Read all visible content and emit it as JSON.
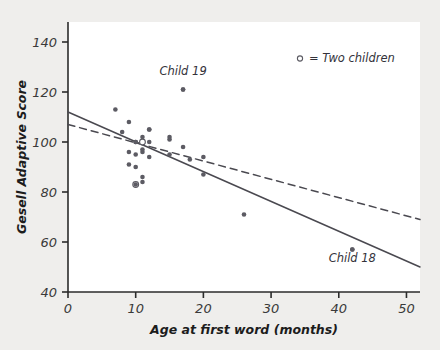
{
  "chart_data": {
    "type": "scatter",
    "title": "",
    "xlabel": "Age at first word (months)",
    "ylabel": "Gesell Adaptive Score",
    "xlim": [
      0,
      52
    ],
    "ylim": [
      40,
      148
    ],
    "xticks": [
      0,
      10,
      20,
      30,
      40,
      50
    ],
    "yticks": [
      40,
      60,
      80,
      100,
      120,
      140
    ],
    "xtick_labels": [
      "0",
      "10",
      "20",
      "30",
      "40",
      "50"
    ],
    "ytick_labels": [
      "40",
      "60",
      "80",
      "100",
      "120",
      "140"
    ],
    "grid": false,
    "legend_position": "top-right",
    "legend": [
      {
        "marker": "open-circle",
        "label": "= Two children"
      }
    ],
    "points": [
      {
        "x": 15,
        "y": 95,
        "marker": "filled"
      },
      {
        "x": 26,
        "y": 71,
        "marker": "filled"
      },
      {
        "x": 10,
        "y": 83,
        "marker": "open",
        "note": "two children"
      },
      {
        "x": 9,
        "y": 91,
        "marker": "filled"
      },
      {
        "x": 15,
        "y": 102,
        "marker": "filled"
      },
      {
        "x": 20,
        "y": 87,
        "marker": "filled"
      },
      {
        "x": 18,
        "y": 93,
        "marker": "filled"
      },
      {
        "x": 11,
        "y": 100,
        "marker": "open",
        "note": "two children"
      },
      {
        "x": 8,
        "y": 104,
        "marker": "filled"
      },
      {
        "x": 20,
        "y": 94,
        "marker": "filled"
      },
      {
        "x": 7,
        "y": 113,
        "marker": "filled"
      },
      {
        "x": 9,
        "y": 96,
        "marker": "filled"
      },
      {
        "x": 10,
        "y": 83,
        "marker": "filled"
      },
      {
        "x": 11,
        "y": 84,
        "marker": "filled"
      },
      {
        "x": 11,
        "y": 102,
        "marker": "filled"
      },
      {
        "x": 10,
        "y": 100,
        "marker": "filled"
      },
      {
        "x": 12,
        "y": 105,
        "marker": "filled"
      },
      {
        "x": 42,
        "y": 57,
        "marker": "filled",
        "label": "Child 18"
      },
      {
        "x": 17,
        "y": 121,
        "marker": "filled",
        "label": "Child 19"
      },
      {
        "x": 11,
        "y": 86,
        "marker": "filled"
      },
      {
        "x": 10,
        "y": 100,
        "marker": "filled"
      },
      {
        "x": 12,
        "y": 105,
        "marker": "filled"
      },
      {
        "x": 42,
        "y": 57,
        "marker": "filled"
      },
      {
        "x": 17,
        "y": 121,
        "marker": "filled"
      },
      {
        "x": 11,
        "y": 96,
        "marker": "filled"
      },
      {
        "x": 10,
        "y": 90,
        "marker": "filled"
      },
      {
        "x": 12,
        "y": 100,
        "marker": "filled"
      },
      {
        "x": 9,
        "y": 108,
        "marker": "filled"
      },
      {
        "x": 17,
        "y": 98,
        "marker": "filled"
      },
      {
        "x": 11,
        "y": 97,
        "marker": "filled"
      },
      {
        "x": 10,
        "y": 95,
        "marker": "filled"
      },
      {
        "x": 15,
        "y": 101,
        "marker": "filled"
      },
      {
        "x": 12,
        "y": 94,
        "marker": "filled"
      }
    ],
    "lines": [
      {
        "name": "all-data-fit",
        "style": "solid",
        "x0": 0,
        "y0": 112,
        "x1": 52,
        "y1": 50
      },
      {
        "name": "fit-without-child-18",
        "style": "dashed",
        "x0": 0,
        "y0": 107,
        "x1": 52,
        "y1": 69
      }
    ],
    "annotations": [
      {
        "text": "Child 19",
        "x": 17,
        "y": 127
      },
      {
        "text": "Child 18",
        "x": 42,
        "y": 52
      }
    ]
  },
  "colors": {
    "background": "#efeeec",
    "plot_background": "#ffffff",
    "axis": "#2b2b2b",
    "point": "#5c5b63",
    "line": "#4a4950",
    "text": "#1c1c1c"
  }
}
